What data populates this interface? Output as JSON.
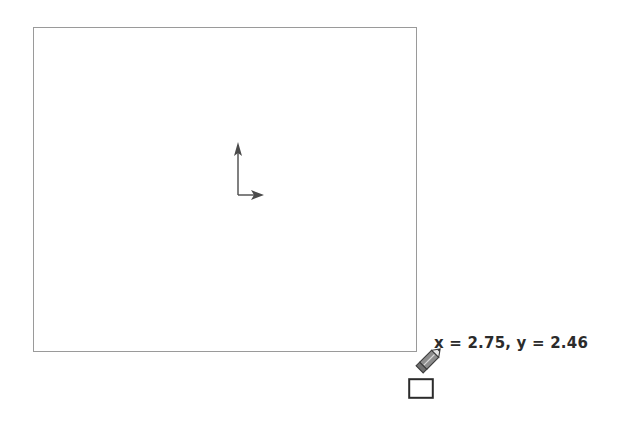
{
  "app": {
    "surface_name": "drawing-canvas",
    "background_color": "#ffffff"
  },
  "canvas": {
    "shape": {
      "type": "rectangle",
      "stroke_color": "#9a9a9a",
      "stroke_width": 1,
      "fill": "none",
      "left": 33,
      "top": 27,
      "width": 384,
      "height": 325
    },
    "axis_indicator": {
      "label": "",
      "color": "#4a4a4a",
      "y_axis_direction": "up",
      "x_axis_direction": "right"
    },
    "cursor": {
      "tool": "pencil",
      "color": "#555555",
      "tip_x": 417,
      "tip_y": 352
    },
    "hotspot_marker": {
      "shape": "square",
      "color": "#2b2b2b"
    }
  },
  "readout": {
    "text": "x = 2.75, y = 2.46",
    "x_label": "x",
    "x_value": "2.75",
    "y_label": "y",
    "y_value": "2.46",
    "color": "#2b2b2b"
  }
}
